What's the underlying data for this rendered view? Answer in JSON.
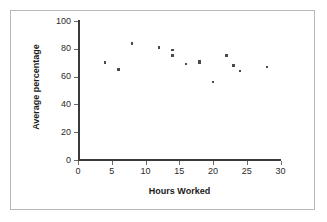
{
  "chart_data": {
    "type": "scatter",
    "title": "",
    "xlabel": "Hours Worked",
    "ylabel": "Average percentage",
    "xlim": [
      0,
      30
    ],
    "ylim": [
      0,
      100
    ],
    "xticks": [
      0,
      5,
      10,
      15,
      20,
      25,
      30
    ],
    "yticks": [
      0,
      20,
      40,
      60,
      80,
      100
    ],
    "grid": false,
    "legend": null,
    "marker": "square",
    "marker_color": "#4a4a4a",
    "points": [
      {
        "x": 4,
        "y": 70
      },
      {
        "x": 6,
        "y": 65
      },
      {
        "x": 8,
        "y": 84
      },
      {
        "x": 12,
        "y": 81
      },
      {
        "x": 14,
        "y": 79
      },
      {
        "x": 14,
        "y": 75
      },
      {
        "x": 16,
        "y": 69
      },
      {
        "x": 18,
        "y": 71
      },
      {
        "x": 18,
        "y": 70
      },
      {
        "x": 20,
        "y": 56
      },
      {
        "x": 22,
        "y": 75
      },
      {
        "x": 23,
        "y": 68
      },
      {
        "x": 24,
        "y": 64
      },
      {
        "x": 28,
        "y": 67
      }
    ]
  },
  "axes": {
    "x_title": "Hours Worked",
    "y_title": "Average percentage",
    "x_tick_labels": [
      "0",
      "5",
      "10",
      "15",
      "20",
      "25",
      "30"
    ],
    "y_tick_labels": [
      "0",
      "20",
      "40",
      "60",
      "80",
      "100"
    ]
  },
  "colors": {
    "frame_border": "#b9b9b9",
    "axis": "#3a3a3a",
    "text": "#1a1a1a",
    "marker": "#4a4a4a",
    "background": "#ffffff"
  }
}
